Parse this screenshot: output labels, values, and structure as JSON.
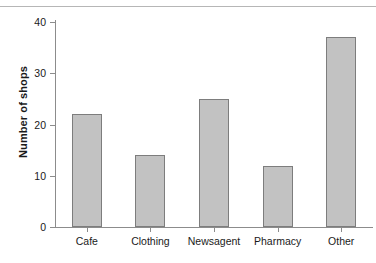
{
  "chart_data": {
    "type": "bar",
    "title": "",
    "xlabel": "",
    "ylabel": "Number of shops",
    "categories": [
      "Cafe",
      "Clothing",
      "Newsagent",
      "Pharmacy",
      "Other"
    ],
    "values": [
      22,
      14,
      25,
      12,
      37
    ],
    "yticks": [
      0,
      10,
      20,
      30,
      40
    ],
    "ytick_labels": [
      "0",
      "10",
      "20",
      "30",
      "40"
    ],
    "ylim": [
      0,
      40
    ],
    "grid": false,
    "legend": false,
    "legend_position": "none",
    "bar_fill_color": "#c2c2c2",
    "bar_edge_color": "#7d7d7d",
    "axis_color": "#8c8c8c",
    "text_color": "#1a1a1a",
    "background_color": "#ffffff",
    "top_rule_color": "#b6b6b6"
  }
}
